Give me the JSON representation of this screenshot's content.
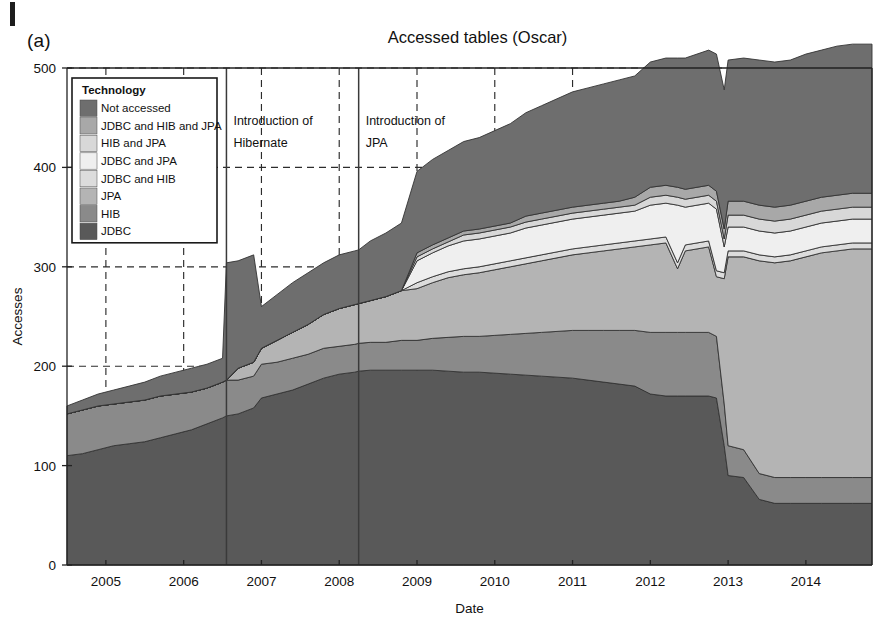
{
  "figure": {
    "panel_label": "(a)",
    "title": "Accessed tables (Oscar)"
  },
  "legend": {
    "title": "Technology",
    "position": "upper-left-inside",
    "items": [
      {
        "label": "Not accessed",
        "color": "#6e6e6e"
      },
      {
        "label": "JDBC and HIB and JPA",
        "color": "#a8a8a8"
      },
      {
        "label": "HIB and JPA",
        "color": "#d8d8d8"
      },
      {
        "label": "JDBC and JPA",
        "color": "#efefef"
      },
      {
        "label": "JDBC and HIB",
        "color": "#dcdcdc"
      },
      {
        "label": "JPA",
        "color": "#b4b4b4"
      },
      {
        "label": "HIB",
        "color": "#8a8a8a"
      },
      {
        "label": "JDBC",
        "color": "#595959"
      }
    ]
  },
  "annotations": [
    {
      "text_line1": "Introduction of",
      "text_line2": "Hibernate",
      "x_value": 2006.55
    },
    {
      "text_line1": "Introduction of",
      "text_line2": "JPA",
      "x_value": 2008.25
    }
  ],
  "chart_data": {
    "type": "area",
    "title": "Accessed tables (Oscar)",
    "subtitle": "",
    "xlabel": "Date",
    "ylabel": "Accesses",
    "stacked": true,
    "grid": true,
    "legend_position": "upper-left-inside",
    "xlim": [
      2004.5,
      2014.85
    ],
    "ylim": [
      0,
      500
    ],
    "yticks": [
      0,
      100,
      200,
      300,
      400,
      500
    ],
    "xticks": [
      2005,
      2006,
      2007,
      2008,
      2009,
      2010,
      2011,
      2012,
      2013,
      2014
    ],
    "xtick_labels": [
      "2005",
      "2006",
      "2007",
      "2008",
      "2009",
      "2010",
      "2011",
      "2012",
      "2013",
      "2014"
    ],
    "x": [
      2004.5,
      2004.7,
      2004.9,
      2005.1,
      2005.3,
      2005.5,
      2005.7,
      2005.9,
      2006.1,
      2006.3,
      2006.5,
      2006.55,
      2006.7,
      2006.9,
      2007.0,
      2007.2,
      2007.4,
      2007.6,
      2007.8,
      2008.0,
      2008.2,
      2008.25,
      2008.4,
      2008.6,
      2008.8,
      2009.0,
      2009.2,
      2009.4,
      2009.6,
      2009.8,
      2010.0,
      2010.2,
      2010.4,
      2010.6,
      2010.8,
      2011.0,
      2011.2,
      2011.4,
      2011.6,
      2011.8,
      2012.0,
      2012.2,
      2012.35,
      2012.45,
      2012.6,
      2012.75,
      2012.85,
      2012.95,
      2013.0,
      2013.2,
      2013.4,
      2013.6,
      2013.8,
      2014.0,
      2014.2,
      2014.4,
      2014.6,
      2014.85
    ],
    "series": [
      {
        "name": "JDBC",
        "values": [
          110,
          112,
          116,
          120,
          122,
          124,
          128,
          132,
          136,
          142,
          148,
          150,
          152,
          158,
          168,
          172,
          176,
          182,
          188,
          192,
          194,
          195,
          196,
          196,
          196,
          196,
          196,
          195,
          194,
          194,
          193,
          192,
          191,
          190,
          189,
          188,
          186,
          184,
          182,
          180,
          172,
          170,
          170,
          170,
          170,
          170,
          168,
          120,
          90,
          88,
          66,
          62,
          62,
          62,
          62,
          62,
          62,
          62
        ]
      },
      {
        "name": "HIB",
        "values": [
          42,
          44,
          44,
          42,
          42,
          42,
          42,
          40,
          38,
          36,
          36,
          36,
          34,
          32,
          34,
          32,
          32,
          30,
          30,
          28,
          28,
          28,
          28,
          28,
          30,
          30,
          32,
          34,
          36,
          36,
          38,
          40,
          42,
          44,
          46,
          48,
          50,
          52,
          54,
          56,
          62,
          64,
          64,
          64,
          64,
          64,
          62,
          42,
          30,
          28,
          26,
          26,
          26,
          26,
          26,
          26,
          26,
          26
        ]
      },
      {
        "name": "JPA",
        "values": [
          0,
          0,
          0,
          0,
          0,
          0,
          0,
          0,
          0,
          0,
          0,
          0,
          12,
          14,
          16,
          22,
          26,
          30,
          34,
          38,
          40,
          40,
          42,
          46,
          50,
          52,
          56,
          60,
          62,
          64,
          66,
          68,
          70,
          72,
          74,
          76,
          78,
          80,
          82,
          84,
          88,
          90,
          64,
          82,
          84,
          86,
          60,
          126,
          190,
          194,
          214,
          216,
          218,
          222,
          226,
          228,
          230,
          230
        ]
      },
      {
        "name": "JDBC and HIB",
        "values": [
          0,
          0,
          0,
          0,
          0,
          0,
          0,
          0,
          0,
          0,
          0,
          0,
          0,
          0,
          0,
          0,
          0,
          0,
          0,
          0,
          0,
          0,
          0,
          0,
          0,
          6,
          6,
          6,
          6,
          6,
          6,
          6,
          6,
          6,
          6,
          6,
          6,
          6,
          6,
          6,
          6,
          6,
          6,
          6,
          6,
          6,
          6,
          6,
          6,
          6,
          6,
          6,
          6,
          6,
          6,
          6,
          6,
          6
        ]
      },
      {
        "name": "JDBC and JPA",
        "values": [
          0,
          0,
          0,
          0,
          0,
          0,
          0,
          0,
          0,
          0,
          0,
          0,
          0,
          0,
          0,
          0,
          0,
          0,
          0,
          0,
          0,
          0,
          0,
          0,
          0,
          22,
          24,
          26,
          28,
          28,
          28,
          28,
          30,
          30,
          30,
          30,
          30,
          30,
          30,
          30,
          34,
          34,
          58,
          38,
          38,
          38,
          62,
          26,
          24,
          24,
          24,
          24,
          24,
          24,
          24,
          24,
          24,
          24
        ]
      },
      {
        "name": "HIB and JPA",
        "values": [
          0,
          0,
          0,
          0,
          0,
          0,
          0,
          0,
          0,
          0,
          0,
          0,
          0,
          0,
          0,
          0,
          0,
          0,
          0,
          0,
          0,
          0,
          0,
          0,
          0,
          4,
          4,
          4,
          6,
          6,
          6,
          6,
          6,
          6,
          6,
          6,
          6,
          6,
          6,
          6,
          8,
          8,
          8,
          8,
          8,
          8,
          8,
          8,
          12,
          12,
          12,
          12,
          12,
          12,
          12,
          12,
          12,
          12
        ]
      },
      {
        "name": "JDBC and HIB and JPA",
        "values": [
          0,
          0,
          0,
          0,
          0,
          0,
          0,
          0,
          0,
          0,
          0,
          0,
          0,
          0,
          0,
          0,
          0,
          0,
          0,
          0,
          0,
          0,
          0,
          0,
          0,
          4,
          4,
          4,
          4,
          4,
          4,
          4,
          6,
          6,
          6,
          6,
          6,
          6,
          6,
          8,
          10,
          10,
          10,
          10,
          10,
          10,
          10,
          10,
          14,
          14,
          14,
          14,
          14,
          14,
          14,
          14,
          14,
          14
        ]
      },
      {
        "name": "Not accessed",
        "values": [
          8,
          10,
          12,
          14,
          16,
          18,
          20,
          22,
          24,
          24,
          24,
          118,
          108,
          108,
          42,
          46,
          50,
          52,
          52,
          54,
          54,
          54,
          60,
          64,
          68,
          82,
          86,
          88,
          90,
          92,
          96,
          100,
          104,
          108,
          112,
          116,
          118,
          120,
          122,
          122,
          126,
          128,
          130,
          132,
          134,
          136,
          138,
          140,
          142,
          144,
          146,
          146,
          146,
          148,
          148,
          150,
          150,
          150
        ]
      }
    ]
  }
}
